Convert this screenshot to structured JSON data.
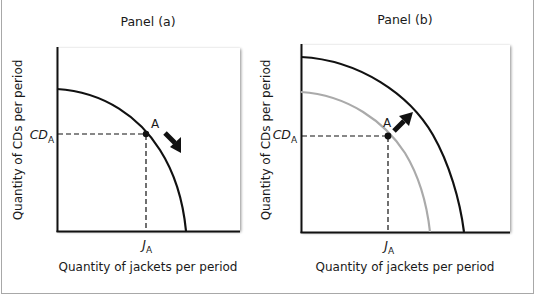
{
  "figure": {
    "panels": [
      {
        "title": "Panel (a)",
        "ylabel": "Quantity of CDs per period",
        "xlabel": "Quantity of jackets per period",
        "y_tick": {
          "main": "CD",
          "sub": "A"
        },
        "x_tick": {
          "main": "J",
          "sub": "A"
        },
        "point_label": "A",
        "arrow_direction": "down-right (movement along curve)",
        "curves": [
          {
            "name": "production possibilities curve",
            "color": "#111111"
          }
        ]
      },
      {
        "title": "Panel (b)",
        "ylabel": "Quantity of CDs per period",
        "xlabel": "Quantity of jackets per period",
        "y_tick": {
          "main": "CD",
          "sub": "A"
        },
        "x_tick": {
          "main": "J",
          "sub": "A"
        },
        "point_label": "A",
        "arrow_direction": "up-right (outward shift)",
        "curves": [
          {
            "name": "original production possibilities curve",
            "color": "#aaaaaa"
          },
          {
            "name": "new production possibilities curve",
            "color": "#111111"
          }
        ]
      }
    ],
    "colors": {
      "axis": "#111111",
      "curve": "#111111",
      "old_curve": "#aaaaaa",
      "frame": "#a8a8a8"
    }
  }
}
